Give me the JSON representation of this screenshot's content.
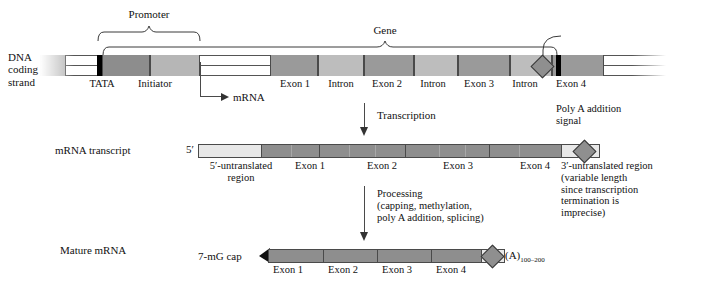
{
  "figure": {
    "title_row_labels": {
      "dna": "DNA\ncoding\nstrand",
      "dna_l1": "DNA",
      "dna_l2": "coding",
      "dna_l3": "strand",
      "transcript": "mRNA transcript",
      "mature": "Mature mRNA"
    }
  },
  "dna_row": {
    "promoter_label": "Promoter",
    "gene_label": "Gene",
    "mrna_start_label": "mRNA",
    "polya_label_l1": "Poly A addition",
    "polya_label_l2": "signal",
    "segment_labels": {
      "tata": "TATA",
      "initiator": "Initiator",
      "exon1": "Exon 1",
      "intron1": "Intron",
      "exon2": "Exon 2",
      "intron2": "Intron",
      "exon3": "Exon 3",
      "intron3": "Intron",
      "exon4": "Exon 4"
    },
    "segments": [
      {
        "name": "upstream",
        "x": 0,
        "w": 26,
        "shade": "#b3b3b3"
      },
      {
        "name": "tata",
        "x": 62,
        "w": 48,
        "shade": "#8d8d8d"
      },
      {
        "name": "initiator",
        "x": 110,
        "w": 50,
        "shade": "#b6b6b6"
      },
      {
        "name": "exon1",
        "x": 230,
        "w": 48,
        "shade": "#9a9a9a"
      },
      {
        "name": "intron1",
        "x": 278,
        "w": 46,
        "shade": "#bdbdbd"
      },
      {
        "name": "exon2",
        "x": 324,
        "w": 50,
        "shade": "#9a9a9a"
      },
      {
        "name": "intron2",
        "x": 374,
        "w": 44,
        "shade": "#bdbdbd"
      },
      {
        "name": "exon3",
        "x": 418,
        "w": 52,
        "shade": "#9a9a9a"
      },
      {
        "name": "intron3",
        "x": 470,
        "w": 42,
        "shade": "#bdbdbd"
      },
      {
        "name": "exon4",
        "x": 512,
        "w": 52,
        "shade": "#9a9a9a"
      }
    ]
  },
  "transcript_row": {
    "five_prime": "5′",
    "utr5_l1": "5′-untranslated",
    "utr5_l2": "region",
    "exon1": "Exon 1",
    "exon2": "Exon 2",
    "exon3": "Exon 3",
    "exon4": "Exon 4",
    "utr3_l1": "3′-untranslated region",
    "utr3_l2": "(variable length",
    "utr3_l3": "since transcription",
    "utr3_l4": "termination is",
    "utr3_l5": "imprecise)"
  },
  "mature_row": {
    "cap_label": "7-mG cap",
    "exon1": "Exon 1",
    "exon2": "Exon 2",
    "exon3": "Exon 3",
    "exon4": "Exon 4",
    "polya_tail": "(A)",
    "polya_tail_sub": "100–200"
  },
  "arrows": {
    "transcription": "Transcription",
    "processing_l1": "Processing",
    "processing_l2": "(capping, methylation,",
    "processing_l3": "poly A addition, splicing)"
  },
  "colors": {
    "exon_fill": "#8e8e8e",
    "intron_fill": "#c4c4c4",
    "utr_fill": "#e8e8e8",
    "outline": "#4a4a4a",
    "black_marker": "#000000",
    "diamond_fill": "#8f8f8f",
    "background": "#ffffff"
  }
}
